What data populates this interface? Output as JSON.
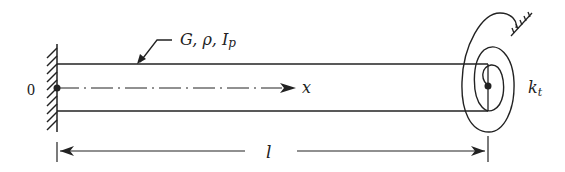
{
  "diagram": {
    "labels": {
      "origin": "0",
      "properties": "G, ρ, I",
      "properties_sub": "p",
      "axis": "x",
      "length": "l",
      "spring": "k",
      "spring_sub": "t"
    },
    "colors": {
      "stroke": "#222222",
      "background": "#ffffff"
    }
  }
}
